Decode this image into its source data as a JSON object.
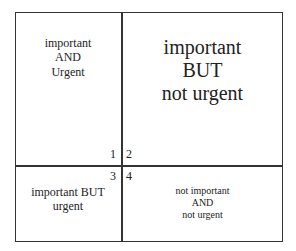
{
  "matrix": {
    "quadrants": [
      {
        "number": "1",
        "lines": [
          "important",
          "AND",
          "Urgent"
        ]
      },
      {
        "number": "2",
        "lines": [
          "important",
          "BUT",
          "not urgent"
        ]
      },
      {
        "number": "3",
        "lines": [
          "important BUT",
          "urgent"
        ]
      },
      {
        "number": "4",
        "lines": [
          "not important",
          "AND",
          "not urgent"
        ]
      }
    ]
  }
}
